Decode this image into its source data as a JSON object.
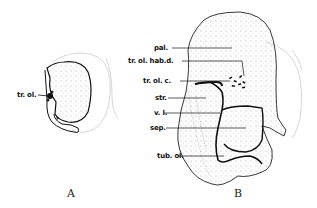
{
  "figure": {
    "panels": [
      {
        "id": "A",
        "label": "A",
        "annotations": [
          {
            "text": "tr. ol."
          }
        ]
      },
      {
        "id": "B",
        "label": "B",
        "annotations": [
          {
            "text": "pal."
          },
          {
            "text": "tr. ol. hab.d."
          },
          {
            "text": "tr. ol. c."
          },
          {
            "text": "str."
          },
          {
            "text": "v. l."
          },
          {
            "text": "sep."
          },
          {
            "text": "tub. ol."
          }
        ]
      }
    ]
  }
}
